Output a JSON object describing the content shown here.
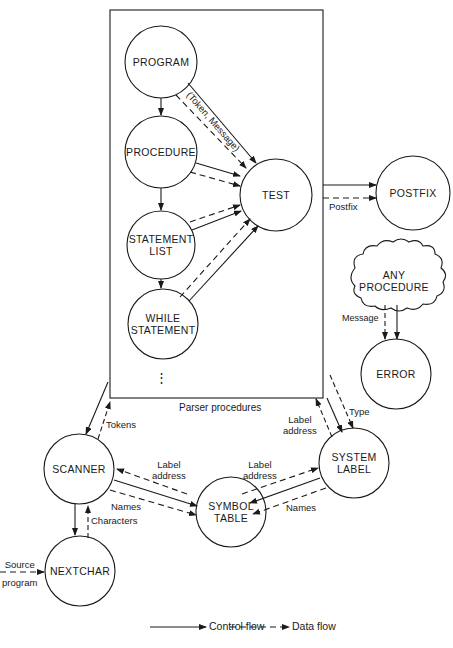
{
  "diagram": {
    "box_label": "Parser procedures",
    "nodes": {
      "program": "PROGRAM",
      "procedure": "PROCEDURE",
      "test": "TEST",
      "statement_list_1": "STATEMENT",
      "statement_list_2": "LIST",
      "while_statement_1": "WHILE",
      "while_statement_2": "STATEMENT",
      "ellipsis": "⋮",
      "postfix": "POSTFIX",
      "any_procedure_1": "ANY",
      "any_procedure_2": "PROCEDURE",
      "error": "ERROR",
      "scanner": "SCANNER",
      "symbol_table_1": "SYMBOL",
      "symbol_table_2": "TABLE",
      "system_label_1": "SYSTEM",
      "system_label_2": "LABEL",
      "nextchar": "NEXTCHAR"
    },
    "edge_labels": {
      "token_message": "(Token, Message)",
      "postfix": "Postfix",
      "message": "Message",
      "tokens": "Tokens",
      "label_address_box_1": "Label",
      "label_address_box_2": "address",
      "type": "Type",
      "label_address_scanner_1": "Label",
      "label_address_scanner_2": "address",
      "label_address_system_1": "Label",
      "label_address_system_2": "address",
      "names_scanner": "Names",
      "names_system": "Names",
      "characters": "Characters",
      "source_program_1": "Source",
      "source_program_2": "program"
    },
    "legend": {
      "control_flow": "Control flow",
      "data_flow": "Data flow"
    },
    "colors": {
      "ink": "#1a1a1a",
      "background": "#ffffff"
    }
  }
}
